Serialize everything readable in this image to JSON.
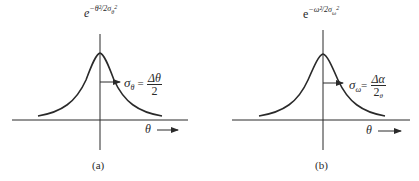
{
  "panels": [
    {
      "id": "a",
      "caption": "(a)",
      "y_label": {
        "base": "e",
        "exponent": "−θ²/2σ",
        "exp_sub": "θ",
        "exp_sup": "2"
      },
      "x_label": "θ",
      "annotation": {
        "lhs": "σ",
        "lhs_sub": "θ",
        "eq": "=",
        "numerator": "Δθ",
        "denominator": "2"
      }
    },
    {
      "id": "b",
      "caption": "(b)",
      "y_label": {
        "base": "e",
        "exponent": "−ω²/2σ",
        "exp_sub": "ω",
        "exp_sup": "2"
      },
      "x_label": "θ",
      "annotation": {
        "lhs": "σ",
        "lhs_sub": "ω",
        "eq": "=",
        "numerator": "Δα",
        "denominator": "2",
        "denominator_sub": "θ"
      }
    }
  ],
  "colors": {
    "ink": "#2a2a2a",
    "background": "#ffffff"
  }
}
